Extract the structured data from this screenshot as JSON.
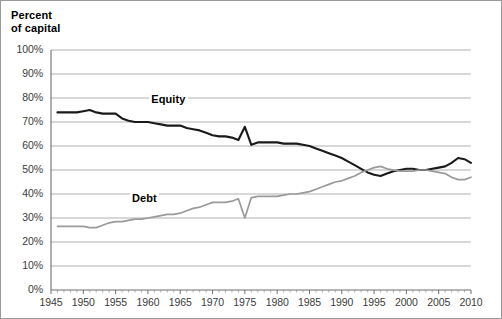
{
  "chart_data": {
    "type": "line",
    "title": "Percent\nof capital",
    "xlabel": "",
    "ylabel": "Percent of capital",
    "xlim": [
      1945,
      2010
    ],
    "ylim": [
      0,
      100
    ],
    "grid": true,
    "legend_position": "inline-annotation",
    "ytick_labels": [
      "100%",
      "90%",
      "80%",
      "70%",
      "60%",
      "50%",
      "40%",
      "30%",
      "20%",
      "10%",
      "0%"
    ],
    "ytick_values": [
      100,
      90,
      80,
      70,
      60,
      50,
      40,
      30,
      20,
      10,
      0
    ],
    "xtick_labels": [
      "1945",
      "1950",
      "1955",
      "1960",
      "1965",
      "1970",
      "1975",
      "1980",
      "1985",
      "1990",
      "1995",
      "2000",
      "2005",
      "2010"
    ],
    "xtick_values": [
      1945,
      1950,
      1955,
      1960,
      1965,
      1970,
      1975,
      1980,
      1985,
      1990,
      1995,
      2000,
      2005,
      2010
    ],
    "x": [
      1946,
      1947,
      1948,
      1949,
      1950,
      1951,
      1952,
      1953,
      1954,
      1955,
      1956,
      1957,
      1958,
      1959,
      1960,
      1961,
      1962,
      1963,
      1964,
      1965,
      1966,
      1967,
      1968,
      1969,
      1970,
      1971,
      1972,
      1973,
      1974,
      1975,
      1976,
      1977,
      1978,
      1979,
      1980,
      1981,
      1982,
      1983,
      1984,
      1985,
      1986,
      1987,
      1988,
      1989,
      1990,
      1991,
      1992,
      1993,
      1994,
      1995,
      1996,
      1997,
      1998,
      1999,
      2000,
      2001,
      2002,
      2003,
      2004,
      2005,
      2006,
      2007,
      2008,
      2009,
      2010
    ],
    "series": [
      {
        "name": "Equity",
        "color": "#1a1a1a",
        "label_x": 1963,
        "label_y": 79,
        "values": [
          74,
          74,
          74,
          74,
          74.5,
          75,
          74,
          73.5,
          73.5,
          73.5,
          71.5,
          70.5,
          70,
          70,
          70,
          69.5,
          69,
          68.5,
          68.5,
          68.5,
          67.5,
          67,
          66.5,
          65.5,
          64.5,
          64,
          64,
          63.5,
          62.5,
          68,
          60.5,
          61.5,
          61.5,
          61.5,
          61.5,
          61,
          61,
          61,
          60.5,
          60,
          59,
          58,
          57,
          56,
          55,
          53.5,
          52,
          50.5,
          49,
          48,
          47.5,
          48.5,
          49.5,
          50,
          50.5,
          50.5,
          50,
          50,
          50.5,
          51,
          51.5,
          53,
          55,
          54.5,
          53
        ]
      },
      {
        "name": "Debt",
        "color": "#9a9a9a",
        "label_x": 1960,
        "label_y": 38,
        "values": [
          26.5,
          26.5,
          26.5,
          26.5,
          26.5,
          26,
          26,
          27,
          28,
          28.5,
          28.5,
          29,
          29.5,
          29.5,
          30,
          30.5,
          31,
          31.5,
          31.5,
          32,
          33,
          34,
          34.5,
          35.5,
          36.5,
          36.5,
          36.5,
          37,
          38,
          30,
          38.5,
          39,
          39,
          39,
          39,
          39.5,
          40,
          40,
          40.5,
          41,
          42,
          43,
          44,
          45,
          45.5,
          46.5,
          47.5,
          49,
          50,
          51,
          51.5,
          50.5,
          50,
          49.5,
          49.5,
          49.5,
          50,
          50,
          49.5,
          49,
          48.5,
          47,
          46,
          46,
          47
        ]
      }
    ]
  }
}
